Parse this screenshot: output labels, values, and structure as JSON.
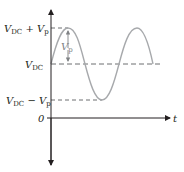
{
  "diagram": {
    "type": "waveform",
    "colors": {
      "axis": "#231f20",
      "wave": "#a7a9ac",
      "dashed": "#6d6e71",
      "annotation": "#808285"
    },
    "labels": {
      "peak": {
        "V": "V",
        "DC": "DC",
        "plus": " + ",
        "Vp": "V",
        "p": "p"
      },
      "dc": {
        "V": "V",
        "DC": "DC"
      },
      "trough": {
        "V": "V",
        "DC": "DC",
        "minus": " − ",
        "Vp": "V",
        "p": "p"
      },
      "zero": "0",
      "time_axis": "t",
      "amplitude_annotation": {
        "V": "V",
        "p": "p"
      }
    },
    "levels": [
      "V_DC + V_p",
      "V_DC",
      "V_DC − V_p",
      "0"
    ]
  }
}
